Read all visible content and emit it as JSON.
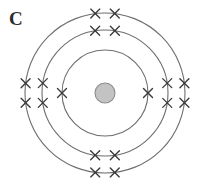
{
  "figure": {
    "label": "C",
    "type": "bohr-atomic-model-diagram",
    "background_color": "#ffffff"
  },
  "nucleus": {
    "name": "nucleus",
    "center_x": 105,
    "center_y": 93,
    "radius": 10,
    "fill_color": "#c3c3c3",
    "stroke_color": "#8c8c8c"
  },
  "shells": [
    {
      "name": "inner-shell",
      "index": 1,
      "radius": 43,
      "electron_count": 2,
      "stroke_color": "#6e6e6e"
    },
    {
      "name": "middle-shell",
      "index": 2,
      "radius": 63,
      "electron_count": 8,
      "stroke_color": "#6e6e6e"
    },
    {
      "name": "outer-shell",
      "index": 3,
      "radius": 80,
      "electron_count": 8,
      "stroke_color": "#6e6e6e"
    }
  ],
  "electron_marks": {
    "glyph": "x-cross",
    "color": "#3a3a3a",
    "size": 9,
    "total_count": 18,
    "positions": [
      {
        "shell": 1,
        "angle_deg": 180
      },
      {
        "shell": 1,
        "angle_deg": 0
      },
      {
        "shell": 2,
        "angle_deg": 99
      },
      {
        "shell": 2,
        "angle_deg": 81
      },
      {
        "shell": 2,
        "angle_deg": 189
      },
      {
        "shell": 2,
        "angle_deg": 171
      },
      {
        "shell": 2,
        "angle_deg": 9
      },
      {
        "shell": 2,
        "angle_deg": 351
      },
      {
        "shell": 2,
        "angle_deg": 279
      },
      {
        "shell": 2,
        "angle_deg": 261
      },
      {
        "shell": 3,
        "angle_deg": 97
      },
      {
        "shell": 3,
        "angle_deg": 83
      },
      {
        "shell": 3,
        "angle_deg": 187
      },
      {
        "shell": 3,
        "angle_deg": 173
      },
      {
        "shell": 3,
        "angle_deg": 7
      },
      {
        "shell": 3,
        "angle_deg": 353
      },
      {
        "shell": 3,
        "angle_deg": 277
      },
      {
        "shell": 3,
        "angle_deg": 263
      }
    ]
  }
}
